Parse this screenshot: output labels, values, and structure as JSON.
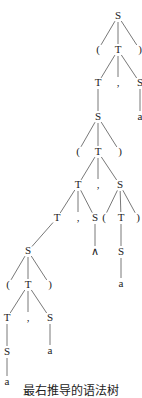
{
  "diagram": {
    "type": "parse-tree",
    "caption": "最右推导的语法树",
    "nodes": [
      {
        "id": "n0",
        "label": "S",
        "x": 118,
        "y": 16
      },
      {
        "id": "n1",
        "label": "(",
        "x": 98,
        "y": 50
      },
      {
        "id": "n2",
        "label": "T",
        "x": 118,
        "y": 50
      },
      {
        "id": "n3",
        "label": ")",
        "x": 140,
        "y": 50
      },
      {
        "id": "n4",
        "label": "T",
        "x": 98,
        "y": 83
      },
      {
        "id": "n5",
        "label": ",",
        "x": 118,
        "y": 83
      },
      {
        "id": "n6",
        "label": "S",
        "x": 140,
        "y": 83
      },
      {
        "id": "n7",
        "label": "S",
        "x": 98,
        "y": 117
      },
      {
        "id": "n8",
        "label": "a",
        "x": 140,
        "y": 117
      },
      {
        "id": "n9",
        "label": "(",
        "x": 78,
        "y": 152
      },
      {
        "id": "n10",
        "label": "T",
        "x": 98,
        "y": 152
      },
      {
        "id": "n11",
        "label": ")",
        "x": 120,
        "y": 152
      },
      {
        "id": "n12",
        "label": "T",
        "x": 78,
        "y": 185
      },
      {
        "id": "n13",
        "label": ",",
        "x": 98,
        "y": 185
      },
      {
        "id": "n14",
        "label": "S",
        "x": 120,
        "y": 185
      },
      {
        "id": "n15",
        "label": "T",
        "x": 57,
        "y": 218
      },
      {
        "id": "n16",
        "label": ",",
        "x": 78,
        "y": 218
      },
      {
        "id": "n17",
        "label": "S",
        "x": 95,
        "y": 218
      },
      {
        "id": "n18",
        "label": "(",
        "x": 104,
        "y": 218
      },
      {
        "id": "n19",
        "label": "T",
        "x": 121,
        "y": 218
      },
      {
        "id": "n20",
        "label": ")",
        "x": 138,
        "y": 218
      },
      {
        "id": "n21",
        "label": "∧",
        "x": 95,
        "y": 252
      },
      {
        "id": "n22",
        "label": "S",
        "x": 121,
        "y": 252
      },
      {
        "id": "n23",
        "label": "a",
        "x": 121,
        "y": 284
      },
      {
        "id": "n24",
        "label": "S",
        "x": 28,
        "y": 251
      },
      {
        "id": "n25",
        "label": "(",
        "x": 8,
        "y": 285
      },
      {
        "id": "n26",
        "label": "T",
        "x": 28,
        "y": 285
      },
      {
        "id": "n27",
        "label": ")",
        "x": 50,
        "y": 285
      },
      {
        "id": "n28",
        "label": "T",
        "x": 7,
        "y": 318
      },
      {
        "id": "n29",
        "label": ",",
        "x": 28,
        "y": 318
      },
      {
        "id": "n30",
        "label": "S",
        "x": 50,
        "y": 318
      },
      {
        "id": "n31",
        "label": "S",
        "x": 7,
        "y": 352
      },
      {
        "id": "n32",
        "label": "a",
        "x": 50,
        "y": 351
      },
      {
        "id": "n33",
        "label": "a",
        "x": 7,
        "y": 382
      }
    ],
    "edges": [
      [
        "n0",
        "n1"
      ],
      [
        "n0",
        "n2"
      ],
      [
        "n0",
        "n3"
      ],
      [
        "n2",
        "n4"
      ],
      [
        "n2",
        "n5"
      ],
      [
        "n2",
        "n6"
      ],
      [
        "n4",
        "n7"
      ],
      [
        "n6",
        "n8"
      ],
      [
        "n7",
        "n9"
      ],
      [
        "n7",
        "n10"
      ],
      [
        "n7",
        "n11"
      ],
      [
        "n10",
        "n12"
      ],
      [
        "n10",
        "n13"
      ],
      [
        "n10",
        "n14"
      ],
      [
        "n12",
        "n15"
      ],
      [
        "n12",
        "n16"
      ],
      [
        "n12",
        "n17"
      ],
      [
        "n14",
        "n18"
      ],
      [
        "n14",
        "n19"
      ],
      [
        "n14",
        "n20"
      ],
      [
        "n17",
        "n21"
      ],
      [
        "n19",
        "n22"
      ],
      [
        "n22",
        "n23"
      ],
      [
        "n15",
        "n24"
      ],
      [
        "n24",
        "n25"
      ],
      [
        "n24",
        "n26"
      ],
      [
        "n24",
        "n27"
      ],
      [
        "n26",
        "n28"
      ],
      [
        "n26",
        "n29"
      ],
      [
        "n26",
        "n30"
      ],
      [
        "n28",
        "n31"
      ],
      [
        "n30",
        "n32"
      ],
      [
        "n31",
        "n33"
      ]
    ]
  }
}
